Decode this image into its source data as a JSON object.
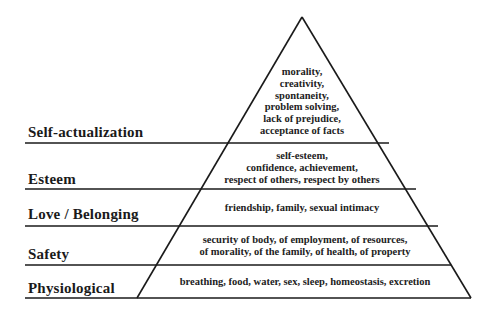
{
  "diagram": {
    "type": "pyramid",
    "line_color": "#1a1a1a",
    "levels": [
      {
        "name": "Self-actualization",
        "description": "morality,\ncreativity,\nspontaneity,\nproblem solving,\nlack of prejudice,\nacceptance of facts"
      },
      {
        "name": "Esteem",
        "description": "self-esteem,\nconfidence, achievement,\nrespect of others, respect by others"
      },
      {
        "name": "Love / Belonging",
        "description": "friendship, family, sexual intimacy"
      },
      {
        "name": "Safety",
        "description": "security of body, of employment, of resources,\nof morality, of the family, of health, of property"
      },
      {
        "name": "Physiological",
        "description": "breathing, food, water, sex, sleep, homeostasis, excretion"
      }
    ]
  }
}
